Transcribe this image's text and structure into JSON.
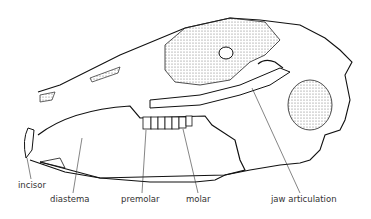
{
  "diagram": {
    "labels": [
      {
        "id": "incisor",
        "text": "incisor",
        "x": 18,
        "y": 180
      },
      {
        "id": "diastema",
        "text": "diastema",
        "x": 50,
        "y": 194
      },
      {
        "id": "premolar",
        "text": "premolar",
        "x": 121,
        "y": 194
      },
      {
        "id": "molar",
        "text": "molar",
        "x": 186,
        "y": 194
      },
      {
        "id": "jaw-articulation",
        "text": "jaw articulation",
        "x": 271,
        "y": 194
      }
    ]
  }
}
